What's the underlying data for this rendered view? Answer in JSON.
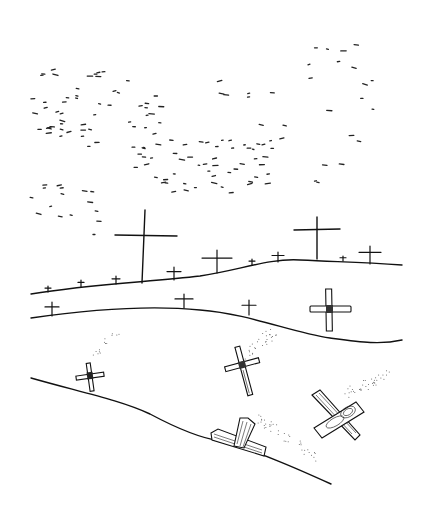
{
  "illustration": {
    "title": "",
    "description": "Line-art drawing of rolling hills dotted with wooden crosses under a sky of scattered dashes (birds/specks); crosses in the foreground are toppled and falling with dust trails.",
    "colors": {
      "ink": "#111111",
      "background": "#ffffff",
      "dust": "#555555"
    },
    "hills": [
      {
        "name": "back-hill",
        "path": "M31 294 C90 284 150 282 200 276 C240 270 270 258 300 260 C340 262 360 262 402 265"
      },
      {
        "name": "middle-hill",
        "path": "M31 318 C100 308 160 306 200 310 C250 314 290 332 330 338 C360 342 380 345 402 340"
      },
      {
        "name": "front-slope",
        "path": "M31 378 C80 392 120 400 150 414 C180 430 200 438 220 441 C260 452 300 470 331 484"
      }
    ],
    "crosses": [
      {
        "name": "tall-cross-left",
        "x": 144,
        "y": 283,
        "h": 73,
        "arm": 60,
        "armY": 236
      },
      {
        "name": "tall-cross-right",
        "x": 317,
        "y": 260,
        "h": 43,
        "arm": 46,
        "armY": 230
      },
      {
        "name": "cross-back-1",
        "x": 217,
        "y": 273,
        "h": 23,
        "arm": 30
      },
      {
        "name": "cross-back-2",
        "x": 174,
        "y": 280,
        "h": 13,
        "arm": 14
      },
      {
        "name": "cross-back-3",
        "x": 278,
        "y": 262,
        "h": 10,
        "arm": 12
      },
      {
        "name": "cross-back-4",
        "x": 370,
        "y": 264,
        "h": 18,
        "arm": 22
      },
      {
        "name": "cross-back-small-1",
        "x": 48,
        "y": 292,
        "h": 6,
        "arm": 6
      },
      {
        "name": "cross-back-small-2",
        "x": 81,
        "y": 287,
        "h": 7,
        "arm": 6
      },
      {
        "name": "cross-back-small-3",
        "x": 116,
        "y": 284,
        "h": 8,
        "arm": 8
      },
      {
        "name": "cross-back-small-4",
        "x": 252,
        "y": 265,
        "h": 6,
        "arm": 6
      },
      {
        "name": "cross-back-small-5",
        "x": 343,
        "y": 261,
        "h": 5,
        "arm": 6
      },
      {
        "name": "cross-mid-1",
        "x": 52,
        "y": 316,
        "h": 14,
        "arm": 14
      },
      {
        "name": "cross-mid-2",
        "x": 184,
        "y": 308,
        "h": 14,
        "arm": 18
      },
      {
        "name": "cross-mid-3",
        "x": 249,
        "y": 315,
        "h": 15,
        "arm": 14
      }
    ]
  }
}
